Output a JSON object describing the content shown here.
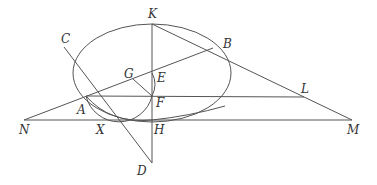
{
  "diagram": {
    "type": "geometry-construction",
    "stroke_color": "#555555",
    "label_color": "#333333",
    "points": {
      "K": {
        "label": "K",
        "x": 152,
        "y": 24,
        "lx": 148,
        "ly": 18
      },
      "B": {
        "label": "B",
        "x": 213,
        "y": 48,
        "lx": 223,
        "ly": 48
      },
      "C": {
        "label": "C",
        "x": 64,
        "y": 47,
        "lx": 61,
        "ly": 43
      },
      "G": {
        "label": "G",
        "x": 133,
        "y": 79,
        "lx": 124,
        "ly": 78
      },
      "E": {
        "label": "E",
        "x": 152,
        "y": 73,
        "lx": 157,
        "ly": 82
      },
      "A": {
        "label": "A",
        "x": 86,
        "y": 96,
        "lx": 77,
        "ly": 114
      },
      "F": {
        "label": "F",
        "x": 152,
        "y": 96,
        "lx": 156,
        "ly": 107
      },
      "L": {
        "label": "L",
        "x": 304,
        "y": 97,
        "lx": 301,
        "ly": 93
      },
      "N": {
        "label": "N",
        "x": 24,
        "y": 120,
        "lx": 19,
        "ly": 134
      },
      "X": {
        "label": "X",
        "x": 104,
        "y": 120,
        "lx": 96,
        "ly": 134
      },
      "H": {
        "label": "H",
        "x": 152,
        "y": 120,
        "lx": 154,
        "ly": 134
      },
      "M": {
        "label": "M",
        "x": 352,
        "y": 120,
        "lx": 347,
        "ly": 134
      },
      "D": {
        "label": "D",
        "x": 152,
        "y": 163,
        "lx": 137,
        "ly": 175
      }
    },
    "ellipse": {
      "cx": 152,
      "cy": 73,
      "rx": 79,
      "ry": 49
    },
    "segments": [
      {
        "from": "K",
        "to": "D",
        "name": "vertical-KD"
      },
      {
        "from": "K",
        "to": "M",
        "name": "line-KLM"
      },
      {
        "from": "N",
        "to": "B",
        "name": "line-NAB"
      },
      {
        "from": "A",
        "to": "L",
        "name": "line-AFL"
      },
      {
        "from": "N",
        "to": "M",
        "name": "line-NXHM"
      },
      {
        "from": "C",
        "to": "D",
        "name": "line-CAD"
      },
      {
        "from": "G",
        "to": "F",
        "name": "line-GF"
      }
    ]
  }
}
